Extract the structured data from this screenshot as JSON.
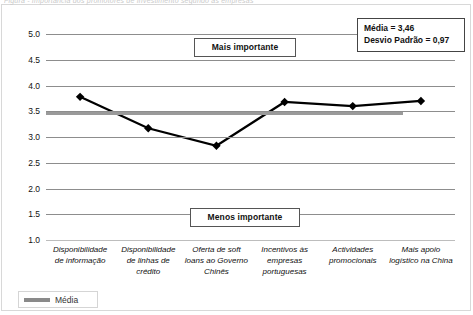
{
  "figure": {
    "caption": "Figura - Importância dos promotores de Investimento segundo as empresas"
  },
  "chart_data": {
    "type": "line",
    "title": "",
    "xlabel": "",
    "ylabel": "",
    "ylim": [
      1.0,
      5.0
    ],
    "ytick_step": 0.5,
    "ytick_labels": [
      "5.0",
      "4.5",
      "4.0",
      "3.5",
      "3.0",
      "2.5",
      "2.0",
      "1.5",
      "1.0"
    ],
    "ytick_values": [
      5.0,
      4.5,
      4.0,
      3.5,
      3.0,
      2.5,
      2.0,
      1.5,
      1.0
    ],
    "grid": true,
    "legend_position": "bottom-left",
    "categories": [
      "Disponibilidade de informação",
      "Disponibilidade de linhas de crédito",
      "Oferta de soft loans ao Governo Chinês",
      "Incentivos às empresas portuguesas",
      "Actividades promocionais",
      "Mais apoio logístico na China"
    ],
    "series": [
      {
        "name": "Importância",
        "marker": "diamond",
        "color": "#000000",
        "values": [
          3.78,
          3.17,
          2.83,
          3.68,
          3.6,
          3.7
        ]
      }
    ],
    "reference_lines": [
      {
        "name": "Média",
        "value": 3.46,
        "color": "#9a9a9a"
      }
    ],
    "annotations": [
      {
        "name": "mais-importante",
        "text": "Mais importante",
        "y": 4.75
      },
      {
        "name": "menos-importante",
        "text": "Menos importante",
        "y": 1.45
      }
    ],
    "stats": {
      "mean_label": "Média = 3,46",
      "stddev_label": "Desvio Padrão = 0,97"
    },
    "legend": [
      {
        "name": "Média",
        "color": "#8a8a8a"
      }
    ]
  }
}
